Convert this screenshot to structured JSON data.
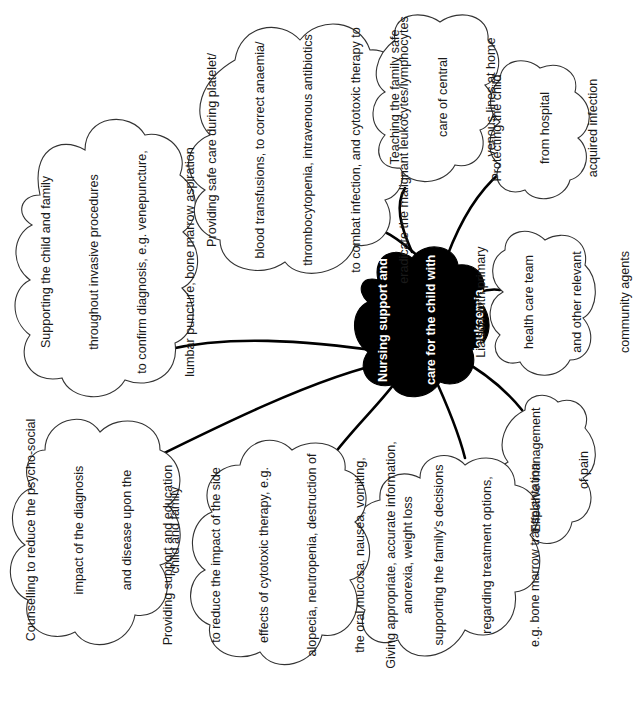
{
  "diagram": {
    "type": "mind-map",
    "colors": {
      "center_fill": "#000000",
      "center_text": "#ffffff",
      "node_fill": "#ffffff",
      "node_stroke": "#333333",
      "edge": "#000000"
    },
    "center": {
      "lines": [
        "Nursing support and",
        "care for the child with",
        "leukaemia"
      ]
    },
    "nodes": [
      {
        "id": "supporting-invasive-procedures",
        "lines": [
          "Supporting the child and family",
          "throughout invasive procedures",
          "to confirm diagnosis, e.g. venepuncture,",
          "lumbar puncture, bone marrow aspiration"
        ]
      },
      {
        "id": "safe-care-transfusions",
        "lines": [
          "Providing safe care during platelet/",
          "blood transfusions, to correct anaemia/",
          "thrombocytopenia, intravenous antibiotics",
          "to combat infection, and cytotoxic therapy to",
          "eradicate the malignant leukocytes/lymphocytes"
        ]
      },
      {
        "id": "central-venous-lines",
        "lines": [
          "Teaching the family safe",
          "care of central",
          "venous lines at home"
        ]
      },
      {
        "id": "hospital-acquired-infection",
        "lines": [
          "Protecting the child",
          "from hospital",
          "acquired infection"
        ]
      },
      {
        "id": "liaison-primary-care",
        "lines": [
          "Liaison with primary",
          "health care team",
          "and other relevant",
          "community agents"
        ]
      },
      {
        "id": "pain-management",
        "lines": [
          "Effective management",
          "of pain"
        ]
      },
      {
        "id": "accurate-information",
        "lines": [
          "Giving appropriate, accurate information,",
          "supporting the family's decisions",
          "regarding treatment options,",
          "e.g. bone marrow transplantation"
        ]
      },
      {
        "id": "side-effects-education",
        "lines": [
          "Providing support and education",
          "to reduce the impact of the side",
          "effects of cytotoxic therapy, e.g.",
          "alopecia, neutropenia, destruction of",
          "the oral mucosa, nausea, vomiting,",
          "anorexia, weight loss"
        ]
      },
      {
        "id": "counselling",
        "lines": [
          "Counselling to reduce the psycho-social",
          "impact of the diagnosis",
          "and disease upon the",
          "child and family"
        ]
      }
    ]
  }
}
